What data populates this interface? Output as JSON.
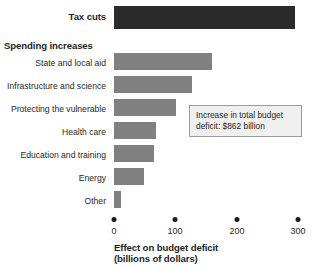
{
  "chart_data": {
    "type": "bar",
    "orientation": "horizontal",
    "title": "",
    "xlabel": "Effect on budget deficit (billions of dollars)",
    "ylabel": "",
    "xlim": [
      0,
      300
    ],
    "xticks": [
      0,
      100,
      200,
      300
    ],
    "xtick_labels": [
      "0",
      "100",
      "200",
      "300"
    ],
    "grid": false,
    "legend": false,
    "categories": [
      "Tax cuts",
      "State and local aid",
      "Infrastructure and science",
      "Protecting the vulnerable",
      "Health care",
      "Education and training",
      "Energy",
      "Other"
    ],
    "values": [
      295,
      160,
      127,
      101,
      69,
      65,
      49,
      12
    ],
    "groups": [
      {
        "label": "Tax cuts",
        "kind": "single",
        "color": "#2b2b2b"
      },
      {
        "label": "Spending increases",
        "kind": "header",
        "color": "#808080"
      }
    ],
    "annotations": [
      "Increase in total budget deficit: $862 billion"
    ]
  },
  "labels": {
    "tax_cuts": "Tax cuts",
    "spending_increases": "Spending increases",
    "state_and_local_aid": "State and local aid",
    "infrastructure_and_science": "Infrastructure and science",
    "protecting_the_vulnerable": "Protecting the vulnerable",
    "health_care": "Health care",
    "education_and_training": "Education and training",
    "energy": "Energy",
    "other": "Other"
  },
  "axis": {
    "tick_0": "0",
    "tick_100": "100",
    "tick_200": "200",
    "tick_300": "300",
    "title_line1": "Effect on budget deficit",
    "title_line2": "(billions of dollars)"
  },
  "callout": {
    "line1": "Increase in total budget",
    "line2": "deficit: $862 billion"
  },
  "colors": {
    "tax_cuts_bar": "#2b2b2b",
    "spending_bar": "#808080",
    "text": "#1f1f1f",
    "callout_bg": "#f0f0f0",
    "callout_border": "#9a9a9a"
  }
}
